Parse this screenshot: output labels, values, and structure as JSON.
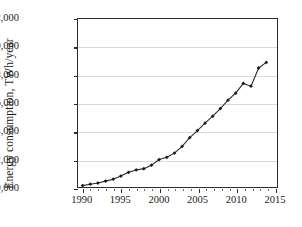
{
  "chart_data": {
    "type": "line",
    "title": "",
    "xlabel": "",
    "ylabel": "Energy consumption, TWh/year",
    "xlim": [
      1989.4,
      2015.4
    ],
    "ylim": [
      10000,
      22000
    ],
    "grid": true,
    "legend": false,
    "marker": "diamond",
    "line_color": "#2b2b2b",
    "marker_color": "#1a1a1a",
    "grid_color": "#d9d9d9",
    "axis_color": "#2b2b2b",
    "xticks": [
      1990,
      1995,
      2000,
      2005,
      2010,
      2015
    ],
    "xtick_labels": [
      "1990",
      "1995",
      "2000",
      "2005",
      "2010",
      "2015"
    ],
    "yticks": [
      10000,
      12000,
      14000,
      16000,
      18000,
      20000,
      22000
    ],
    "ytick_labels": [
      "10,000",
      "12,000",
      "14,000",
      "16,000",
      "18,000",
      "20,000",
      "22,000"
    ],
    "x": [
      1990,
      1991,
      1992,
      1993,
      1994,
      1995,
      1996,
      1997,
      1998,
      1999,
      2000,
      2001,
      2002,
      2003,
      2004,
      2005,
      2006,
      2007,
      2008,
      2009,
      2010,
      2011,
      2012,
      2013,
      2014
    ],
    "values": [
      10100,
      10200,
      10280,
      10420,
      10560,
      10780,
      11050,
      11220,
      11310,
      11560,
      11960,
      12120,
      12420,
      12900,
      13520,
      14030,
      14560,
      15060,
      15600,
      16200,
      16700,
      17400,
      17200,
      18500,
      18900
    ],
    "series": [
      {
        "name": "Energy consumption",
        "values": [
          10100,
          10200,
          10280,
          10420,
          10560,
          10780,
          11050,
          11220,
          11310,
          11560,
          11960,
          12120,
          12420,
          12900,
          13520,
          14030,
          14560,
          15060,
          15600,
          16200,
          16700,
          17400,
          17200,
          18500,
          18900
        ]
      }
    ]
  }
}
